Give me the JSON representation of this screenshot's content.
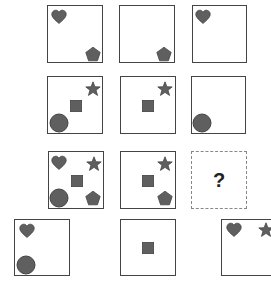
{
  "puzzle": {
    "fill_color": "#5f5f5f",
    "stroke_color": "#444444",
    "grid": [
      {
        "id": "r1c1",
        "x": 47,
        "y": 5,
        "w": 56,
        "h": 58,
        "shapes": [
          {
            "type": "heart",
            "cx": 11,
            "cy": 11
          },
          {
            "type": "pentagon",
            "cx": 45,
            "cy": 48
          }
        ]
      },
      {
        "id": "r1c2",
        "x": 119,
        "y": 5,
        "w": 56,
        "h": 58,
        "shapes": [
          {
            "type": "pentagon",
            "cx": 44,
            "cy": 48
          }
        ]
      },
      {
        "id": "r1c3",
        "x": 192,
        "y": 5,
        "w": 55,
        "h": 58,
        "shapes": [
          {
            "type": "heart",
            "cx": 10,
            "cy": 11
          }
        ]
      },
      {
        "id": "r2c1",
        "x": 47,
        "y": 76,
        "w": 56,
        "h": 58,
        "shapes": [
          {
            "type": "star",
            "cx": 45,
            "cy": 12
          },
          {
            "type": "square",
            "cx": 28,
            "cy": 29
          },
          {
            "type": "circle",
            "cx": 11,
            "cy": 46
          }
        ]
      },
      {
        "id": "r2c2",
        "x": 120,
        "y": 76,
        "w": 56,
        "h": 58,
        "shapes": [
          {
            "type": "star",
            "cx": 44,
            "cy": 12
          },
          {
            "type": "square",
            "cx": 27,
            "cy": 29
          }
        ]
      },
      {
        "id": "r2c3",
        "x": 191,
        "y": 76,
        "w": 55,
        "h": 58,
        "shapes": [
          {
            "type": "circle",
            "cx": 10,
            "cy": 46
          }
        ]
      },
      {
        "id": "r3c1",
        "x": 48,
        "y": 151,
        "w": 56,
        "h": 58,
        "shapes": [
          {
            "type": "heart",
            "cx": 10,
            "cy": 11
          },
          {
            "type": "star",
            "cx": 45,
            "cy": 12
          },
          {
            "type": "square",
            "cx": 28,
            "cy": 29
          },
          {
            "type": "circle",
            "cx": 10,
            "cy": 46
          },
          {
            "type": "pentagon",
            "cx": 44,
            "cy": 46
          }
        ]
      },
      {
        "id": "r3c2",
        "x": 120,
        "y": 151,
        "w": 56,
        "h": 58,
        "shapes": [
          {
            "type": "star",
            "cx": 44,
            "cy": 12
          },
          {
            "type": "square",
            "cx": 27,
            "cy": 29
          },
          {
            "type": "pentagon",
            "cx": 44,
            "cy": 46
          }
        ]
      },
      {
        "id": "r3c3",
        "x": 191,
        "y": 151,
        "w": 56,
        "h": 58,
        "dashed": true,
        "label": "?",
        "shapes": []
      }
    ],
    "options": [
      {
        "id": "option-1",
        "x": 14,
        "y": 219,
        "w": 56,
        "h": 57,
        "shapes": [
          {
            "type": "heart",
            "cx": 12,
            "cy": 11
          },
          {
            "type": "circle",
            "cx": 11,
            "cy": 45
          }
        ]
      },
      {
        "id": "option-2",
        "x": 120,
        "y": 219,
        "w": 56,
        "h": 57,
        "shapes": [
          {
            "type": "square",
            "cx": 27,
            "cy": 28
          }
        ]
      },
      {
        "id": "option-3",
        "x": 221,
        "y": 219,
        "w": 60,
        "h": 57,
        "shapes": [
          {
            "type": "heart",
            "cx": 12,
            "cy": 10
          },
          {
            "type": "star",
            "cx": 44,
            "cy": 10
          }
        ]
      }
    ]
  }
}
